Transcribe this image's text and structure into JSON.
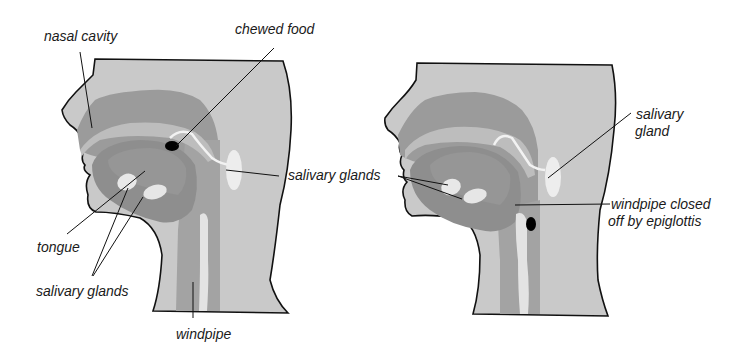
{
  "diagram": {
    "colors": {
      "skin": "#c8c8c8",
      "cavity": "#9a9a9a",
      "tongue": "#8c8c8c",
      "gland": "#ececec",
      "food": "#000000",
      "outline": "#111111",
      "background": "#ffffff"
    },
    "left_panel": {
      "labels": {
        "nasal_cavity": "nasal cavity",
        "chewed_food": "chewed food",
        "salivary_glands_shared": "salivary glands",
        "tongue": "tongue",
        "salivary_glands_bottom": "salivary glands",
        "windpipe": "windpipe"
      }
    },
    "right_panel": {
      "labels": {
        "salivary_gland_line1": "salivary",
        "salivary_gland_line2": "gland",
        "windpipe_closed_line1": "windpipe closed",
        "windpipe_closed_line2": "off by epiglottis"
      }
    }
  }
}
